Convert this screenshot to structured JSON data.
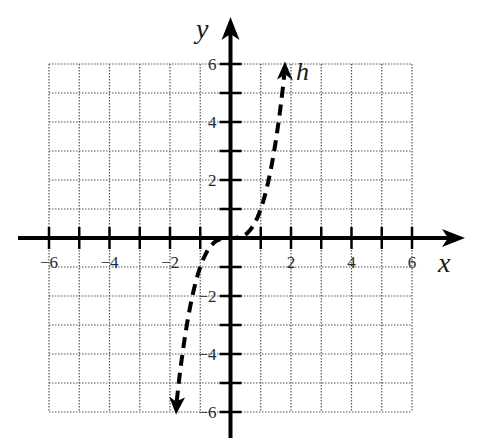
{
  "chart_data": {
    "type": "line",
    "title": "",
    "xlabel": "x",
    "ylabel": "y",
    "xlim": [
      -6,
      6
    ],
    "ylim": [
      -6,
      6
    ],
    "grid": true,
    "grid_style": "dotted",
    "x_ticks": [
      -6,
      -5,
      -4,
      -3,
      -2,
      -1,
      0,
      1,
      2,
      3,
      4,
      5,
      6
    ],
    "y_ticks": [
      -6,
      -5,
      -4,
      -3,
      -2,
      -1,
      0,
      1,
      2,
      3,
      4,
      5,
      6
    ],
    "x_tick_labels": [
      {
        "value": -6,
        "label": "−6"
      },
      {
        "value": -4,
        "label": "−4"
      },
      {
        "value": -2,
        "label": "−2"
      },
      {
        "value": 2,
        "label": "2"
      },
      {
        "value": 4,
        "label": "4"
      },
      {
        "value": 6,
        "label": "6"
      }
    ],
    "y_tick_labels": [
      {
        "value": 6,
        "label": "6"
      },
      {
        "value": 4,
        "label": "4"
      },
      {
        "value": 2,
        "label": "2"
      },
      {
        "value": -2,
        "label": "−2"
      },
      {
        "value": -4,
        "label": "−4"
      },
      {
        "value": -6,
        "label": "−6"
      }
    ],
    "series": [
      {
        "name": "h",
        "style": "dashed",
        "arrows": "both",
        "description": "increasing cubic-like curve through origin",
        "x": [
          -1.8,
          -1.5,
          -1.0,
          -0.5,
          0,
          0.5,
          1.0,
          1.5,
          1.8
        ],
        "y": [
          -5.8,
          -3.4,
          -1.0,
          -0.13,
          0,
          0.13,
          1.0,
          3.4,
          5.8
        ]
      }
    ],
    "annotations": [
      {
        "text": "h",
        "x": 2.3,
        "y": 5.6
      }
    ]
  },
  "labels": {
    "x_axis": "x",
    "y_axis": "y",
    "curve": "h"
  }
}
